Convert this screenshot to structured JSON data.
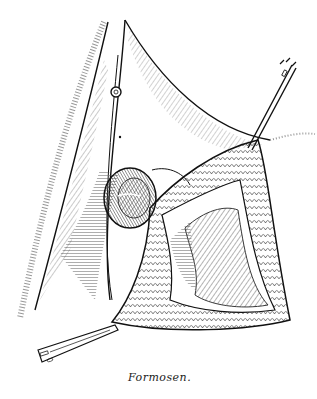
{
  "illustration": {
    "style": "pen-and-ink surgical illustration",
    "subject": "retracted tissue flap exposing a cavity, held by forceps (top right) and a scalpel (bottom left)",
    "signature": "Formosen.",
    "colors": {
      "background": "#ffffff",
      "ink": "#111111",
      "hatch": "#555555"
    },
    "elements": [
      {
        "name": "tissue-fold-left",
        "description": "curved hatched fold on the left"
      },
      {
        "name": "ring-eyelet",
        "description": "small round ring near top center"
      },
      {
        "name": "round-structure",
        "description": "dark hatched round structure with slit, mid-left"
      },
      {
        "name": "tissue-flap",
        "description": "stippled/scaled retracted flap forming triangular opening"
      },
      {
        "name": "inner-cavity",
        "description": "hatched textured interior of opening"
      },
      {
        "name": "forceps",
        "description": "instrument entering from top right"
      },
      {
        "name": "scalpel",
        "description": "instrument entering from bottom left"
      }
    ]
  }
}
